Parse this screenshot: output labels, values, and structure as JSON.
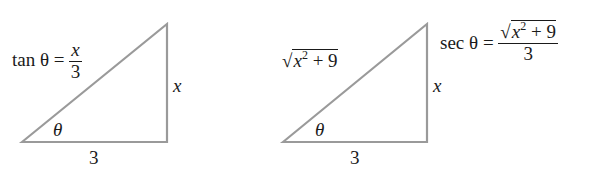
{
  "diagrams": [
    {
      "equation": {
        "lhs": "tan θ",
        "eq": "=",
        "num": "x",
        "den": "3"
      },
      "labels": {
        "opposite": "x",
        "adjacent": "3",
        "angle": "θ"
      }
    },
    {
      "equation": {
        "lhs": "sec θ",
        "eq": "=",
        "num_radical": "x",
        "num_exp": "2",
        "num_rest": " + 9",
        "den": "3"
      },
      "labels": {
        "hyp_radical": "x",
        "hyp_exp": "2",
        "hyp_rest": " + 9",
        "opposite": "x",
        "adjacent": "3",
        "angle": "θ"
      }
    }
  ],
  "colors": {
    "line": "#9a9a9a",
    "text": "#1a1a1a"
  }
}
